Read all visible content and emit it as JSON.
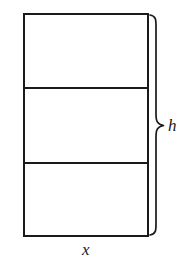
{
  "figure": {
    "type": "geometry-diagram",
    "background_color": "#ffffff",
    "stroke_color": "#1a1a1a",
    "rectangle": {
      "name": "subdivided-rectangle",
      "left": 24,
      "top": 14,
      "right": 148,
      "bottom": 236,
      "width": 124,
      "height": 222,
      "stroke_width": 2
    },
    "dividers": [
      {
        "name": "divider-upper",
        "y": 88,
        "x_start": 24,
        "x_end": 148,
        "stroke_width": 2
      },
      {
        "name": "divider-lower",
        "y": 163,
        "x_start": 24,
        "x_end": 148,
        "stroke_width": 2
      }
    ],
    "bands": [
      {
        "name": "band-top",
        "top": 14,
        "bottom": 88
      },
      {
        "name": "band-middle",
        "top": 88,
        "bottom": 163
      },
      {
        "name": "band-bottom",
        "top": 163,
        "bottom": 236
      }
    ],
    "brace": {
      "name": "height-brace",
      "orientation": "right",
      "x_spine": 156,
      "x_tip": 164,
      "x_end": 150,
      "top": 14,
      "bottom": 236,
      "tip_y": 126,
      "stroke_width": 1.6
    },
    "labels": {
      "height": {
        "name": "height-label",
        "text": "h",
        "variable": "h",
        "meaning": "total height of the rectangle",
        "x": 172,
        "y": 126,
        "style": "italic-serif"
      },
      "width": {
        "name": "width-label",
        "text": "x",
        "variable": "x",
        "meaning": "width of the rectangle",
        "x": 87,
        "y": 250,
        "style": "italic-serif"
      }
    }
  }
}
